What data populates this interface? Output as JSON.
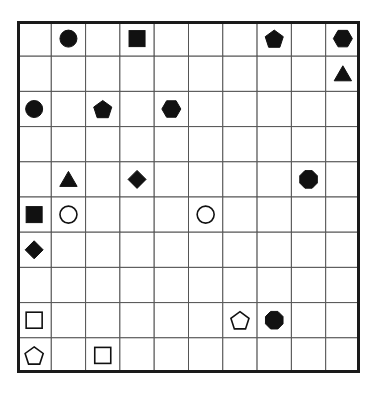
{
  "board": {
    "rows": 10,
    "cols": 10,
    "line_color": "#555555",
    "border_color": "#1a1a1a",
    "fill_color": "#111111",
    "pieces": [
      {
        "row": 0,
        "col": 1,
        "shape": "circle",
        "filled": true
      },
      {
        "row": 0,
        "col": 3,
        "shape": "square",
        "filled": true
      },
      {
        "row": 0,
        "col": 7,
        "shape": "pentagon",
        "filled": true
      },
      {
        "row": 0,
        "col": 9,
        "shape": "hexagon",
        "filled": true
      },
      {
        "row": 1,
        "col": 9,
        "shape": "triangle",
        "filled": true
      },
      {
        "row": 2,
        "col": 0,
        "shape": "circle",
        "filled": true
      },
      {
        "row": 2,
        "col": 2,
        "shape": "pentagon",
        "filled": true
      },
      {
        "row": 2,
        "col": 4,
        "shape": "hexagon",
        "filled": true
      },
      {
        "row": 4,
        "col": 1,
        "shape": "triangle",
        "filled": true
      },
      {
        "row": 4,
        "col": 3,
        "shape": "diamond",
        "filled": true
      },
      {
        "row": 4,
        "col": 8,
        "shape": "octagon",
        "filled": true
      },
      {
        "row": 5,
        "col": 0,
        "shape": "square",
        "filled": true
      },
      {
        "row": 5,
        "col": 1,
        "shape": "circle",
        "filled": false
      },
      {
        "row": 5,
        "col": 5,
        "shape": "circle",
        "filled": false
      },
      {
        "row": 6,
        "col": 0,
        "shape": "diamond",
        "filled": true
      },
      {
        "row": 8,
        "col": 0,
        "shape": "square",
        "filled": false
      },
      {
        "row": 8,
        "col": 6,
        "shape": "pentagon",
        "filled": false
      },
      {
        "row": 8,
        "col": 7,
        "shape": "octagon",
        "filled": true
      },
      {
        "row": 9,
        "col": 0,
        "shape": "pentagon",
        "filled": false
      },
      {
        "row": 9,
        "col": 2,
        "shape": "square",
        "filled": false
      }
    ]
  }
}
